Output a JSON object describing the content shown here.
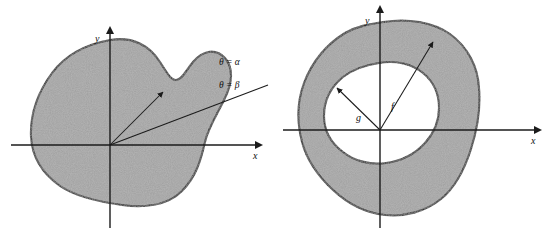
{
  "figure": {
    "background_color": "#ffffff",
    "ink_color": "#111111",
    "fill_color": "#9f9f9f",
    "panels": [
      {
        "id": "left",
        "name": "polar-region-single-curve",
        "axes": {
          "x_label": "x",
          "y_label": "y"
        },
        "shaded_region": {
          "label": "bean-shaped-shaded-region",
          "fill": "#9f9f9f"
        },
        "rays": [
          {
            "id": "alpha",
            "label": "θ = α"
          },
          {
            "id": "beta",
            "label": "θ = β"
          }
        ]
      },
      {
        "id": "right",
        "name": "polar-annular-region-two-curves",
        "axes": {
          "x_label": "x",
          "y_label": "y"
        },
        "shaded_region": {
          "label": "annular-shaded-region",
          "fill": "#9f9f9f"
        },
        "radius_arrows": [
          {
            "id": "g",
            "label": "g"
          },
          {
            "id": "f",
            "label": "f"
          }
        ]
      }
    ]
  }
}
